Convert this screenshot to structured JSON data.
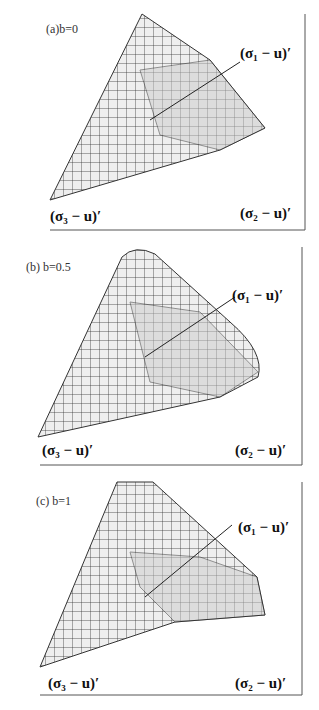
{
  "figure": {
    "panels": [
      {
        "label": "(a)b=0",
        "axis_x": "(σ₂ − u)′",
        "axis_y": "(σ₁ − u)′",
        "axis_z": "(σ₃ − u)′"
      },
      {
        "label": "(b) b=0.5",
        "axis_x": "(σ₂ − u)′",
        "axis_y": "(σ₁ − u)′",
        "axis_z": "(σ₃ − u)′"
      },
      {
        "label": "(c) b=1",
        "axis_x": "(σ₂ − u)′",
        "axis_y": "(σ₁ − u)′",
        "axis_z": "(σ₃ − u)′"
      }
    ]
  }
}
